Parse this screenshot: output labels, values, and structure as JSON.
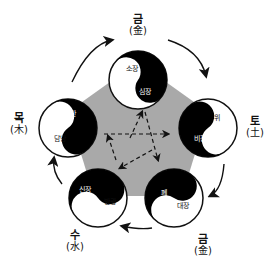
{
  "colors": {
    "pentagon": "#a9a9a9",
    "yin": "#000000",
    "yang": "#ffffff",
    "stroke": "#111111"
  },
  "elements": {
    "top": {
      "korean": "금",
      "hanja": "(金)",
      "yang_organ": "소장",
      "yin_organ": "심장"
    },
    "right": {
      "korean": "토",
      "hanja": "(土)",
      "yang_organ": "위",
      "yin_organ": "비장"
    },
    "bottom_right": {
      "korean": "금",
      "hanja": "(金)",
      "yang_organ": "대장",
      "yin_organ": "폐"
    },
    "bottom_left": {
      "korean": "수",
      "hanja": "(水)",
      "yang_organ": "방광",
      "yin_organ": "신장"
    },
    "left": {
      "korean": "목",
      "hanja": "(木)",
      "yang_organ": "담낭",
      "yin_organ": "간"
    }
  },
  "arrows": {
    "outer_cycle": "clockwise generating cycle",
    "inner_star": "dashed pentagram controlling cycle"
  }
}
